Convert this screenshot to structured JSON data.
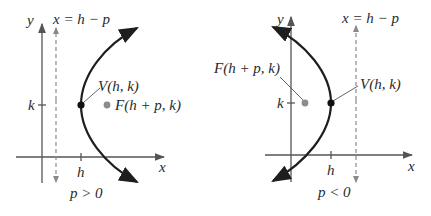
{
  "panels": [
    {
      "id": "left",
      "condition": "p > 0",
      "directrix_label": "x = h − p",
      "vertex_label": "V(h, k)",
      "focus_label": "F(h + p, k)",
      "axis_x_label": "x",
      "axis_y_label": "y",
      "tick_h_label": "h",
      "tick_k_label": "k",
      "opens": "right"
    },
    {
      "id": "right",
      "condition": "p < 0",
      "directrix_label": "x = h − p",
      "vertex_label": "V(h, k)",
      "focus_label": "F(h + p, k)",
      "axis_x_label": "x",
      "axis_y_label": "y",
      "tick_h_label": "h",
      "tick_k_label": "k",
      "opens": "left"
    }
  ],
  "colors": {
    "curve": "#1e1e1e",
    "axis": "#555555",
    "directrix": "#8a8a8a",
    "focus": "#8c8c8c",
    "vertex": "#111111",
    "text": "#2a2a2a"
  }
}
